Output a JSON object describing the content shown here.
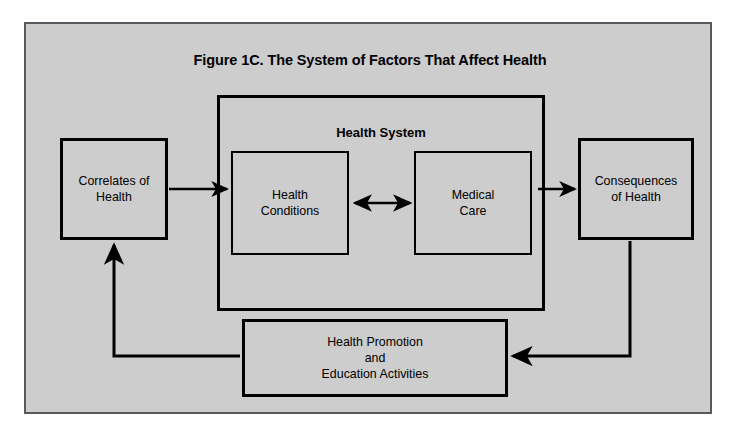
{
  "figure": {
    "title": "Figure 1C. The System of Factors That Affect Health",
    "background_color": "#cdcdcd",
    "frame_border_color": "#555a5e",
    "line_color": "#000000",
    "text_color": "#000000"
  },
  "container": {
    "label": "Health System"
  },
  "nodes": [
    {
      "id": "correlates",
      "label": "Correlates of\nHealth",
      "line1": "Correlates of",
      "line2": "Health"
    },
    {
      "id": "health-conditions",
      "label": "Health\nConditions",
      "line1": "Health",
      "line2": "Conditions"
    },
    {
      "id": "medical-care",
      "label": "Medical\nCare",
      "line1": "Medical",
      "line2": "Care"
    },
    {
      "id": "consequences",
      "label": "Consequences\nof Health",
      "line1": "Consequences",
      "line2": "of Health"
    },
    {
      "id": "health-promotion",
      "label": "Health Promotion\nand\nEducation Activities",
      "line1": "Health Promotion",
      "line2": "and",
      "line3": "Education Activities"
    }
  ],
  "connectors": [
    {
      "id": "correlates-to-health-conditions",
      "from": "correlates",
      "to": "health-conditions",
      "direction": "forward"
    },
    {
      "id": "health-conditions-to-medical-care",
      "from": "health-conditions",
      "to": "medical-care",
      "direction": "bidirectional"
    },
    {
      "id": "medical-care-to-consequences",
      "from": "medical-care",
      "to": "consequences",
      "direction": "forward"
    },
    {
      "id": "consequences-to-health-promotion",
      "from": "consequences",
      "to": "health-promotion",
      "direction": "forward"
    },
    {
      "id": "health-promotion-to-correlates",
      "from": "health-promotion",
      "to": "correlates",
      "direction": "forward"
    }
  ]
}
